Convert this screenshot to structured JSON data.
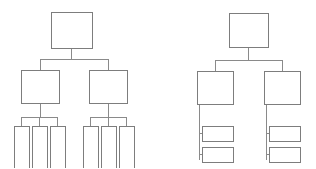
{
  "page": {
    "background_color": "#ffffff",
    "width": 316,
    "height": 168
  },
  "style": {
    "box_fill": "#ffffff",
    "box_stroke": "#7d7d7d",
    "connector_stroke": "#8a8a8a",
    "stroke_width": 1
  },
  "diagrams": [
    {
      "id": "left-tree",
      "name": "left-tree-diagram",
      "label": "",
      "layout": "centered-branching",
      "levels": 3,
      "nodes": [
        {
          "id": "L-root",
          "name": "left-root-node",
          "label": "",
          "x": 51,
          "y": 12,
          "w": 41,
          "h": 36,
          "level": 0
        },
        {
          "id": "L-m1",
          "name": "left-mid-node-1",
          "label": "",
          "x": 21,
          "y": 70,
          "w": 38,
          "h": 33,
          "level": 1
        },
        {
          "id": "L-m2",
          "name": "left-mid-node-2",
          "label": "",
          "x": 89,
          "y": 70,
          "w": 38,
          "h": 33,
          "level": 1
        },
        {
          "id": "L-a1",
          "name": "left-leaf-node-1",
          "label": "",
          "x": 14,
          "y": 126,
          "w": 15,
          "h": 42,
          "level": 2
        },
        {
          "id": "L-a2",
          "name": "left-leaf-node-2",
          "label": "",
          "x": 32,
          "y": 126,
          "w": 15,
          "h": 42,
          "level": 2
        },
        {
          "id": "L-a3",
          "name": "left-leaf-node-3",
          "label": "",
          "x": 50,
          "y": 126,
          "w": 15,
          "h": 42,
          "level": 2
        },
        {
          "id": "L-b1",
          "name": "left-leaf-node-4",
          "label": "",
          "x": 83,
          "y": 126,
          "w": 15,
          "h": 42,
          "level": 2
        },
        {
          "id": "L-b2",
          "name": "left-leaf-node-5",
          "label": "",
          "x": 101,
          "y": 126,
          "w": 15,
          "h": 42,
          "level": 2
        },
        {
          "id": "L-b3",
          "name": "left-leaf-node-6",
          "label": "",
          "x": 119,
          "y": 126,
          "w": 15,
          "h": 42,
          "level": 2
        }
      ],
      "connectors": [
        {
          "name": "left-root-stem",
          "d": "M71.5,48 L71.5,59"
        },
        {
          "name": "left-root-bus",
          "d": "M40,59 L108,59"
        },
        {
          "name": "left-bus-drop-1",
          "d": "M40,59 L40,70"
        },
        {
          "name": "left-bus-drop-2",
          "d": "M108,59 L108,70"
        },
        {
          "name": "left-mid1-stem",
          "d": "M40,103 L40,117"
        },
        {
          "name": "left-mid1-bus",
          "d": "M21.5,117 L57.5,117"
        },
        {
          "name": "left-leaf1-drop",
          "d": "M21.5,117 L21.5,126"
        },
        {
          "name": "left-leaf2-drop",
          "d": "M39.5,117 L39.5,126"
        },
        {
          "name": "left-leaf3-drop",
          "d": "M57.5,117 L57.5,126"
        },
        {
          "name": "left-mid2-stem",
          "d": "M108,103 L108,117"
        },
        {
          "name": "left-mid2-bus",
          "d": "M90.5,117 L126.5,117"
        },
        {
          "name": "left-leaf4-drop",
          "d": "M90.5,117 L90.5,126"
        },
        {
          "name": "left-leaf5-drop",
          "d": "M108.5,117 L108.5,126"
        },
        {
          "name": "left-leaf6-drop",
          "d": "M126.5,117 L126.5,126"
        }
      ]
    },
    {
      "id": "right-tree",
      "name": "right-tree-diagram",
      "label": "",
      "layout": "left-spine-branching",
      "levels": 3,
      "nodes": [
        {
          "id": "R-root",
          "name": "right-root-node",
          "label": "",
          "x": 229,
          "y": 13,
          "w": 39,
          "h": 34,
          "level": 0
        },
        {
          "id": "R-m1",
          "name": "right-mid-node-1",
          "label": "",
          "x": 197,
          "y": 71,
          "w": 36,
          "h": 33,
          "level": 1
        },
        {
          "id": "R-m2",
          "name": "right-mid-node-2",
          "label": "",
          "x": 264,
          "y": 71,
          "w": 36,
          "h": 33,
          "level": 1
        },
        {
          "id": "R-a1",
          "name": "right-leaf-node-1",
          "label": "",
          "x": 202,
          "y": 126,
          "w": 31,
          "h": 15,
          "level": 2
        },
        {
          "id": "R-a2",
          "name": "right-leaf-node-2",
          "label": "",
          "x": 202,
          "y": 147,
          "w": 31,
          "h": 15,
          "level": 2
        },
        {
          "id": "R-b1",
          "name": "right-leaf-node-3",
          "label": "",
          "x": 269,
          "y": 126,
          "w": 31,
          "h": 15,
          "level": 2
        },
        {
          "id": "R-b2",
          "name": "right-leaf-node-4",
          "label": "",
          "x": 269,
          "y": 147,
          "w": 31,
          "h": 15,
          "level": 2
        }
      ],
      "connectors": [
        {
          "name": "right-root-stem",
          "d": "M248.5,47 L248.5,60"
        },
        {
          "name": "right-root-bus",
          "d": "M215,60 L282,60"
        },
        {
          "name": "right-bus-drop-1",
          "d": "M215,60 L215,71"
        },
        {
          "name": "right-bus-drop-2",
          "d": "M282,60 L282,71"
        },
        {
          "name": "right-mid1-spine",
          "d": "M199,104 L199,160"
        },
        {
          "name": "right-leaf1-arm",
          "d": "M199,133.5 L202,133.5"
        },
        {
          "name": "right-leaf2-arm",
          "d": "M199,154.5 L202,154.5"
        },
        {
          "name": "right-mid2-spine",
          "d": "M266,104 L266,160"
        },
        {
          "name": "right-leaf3-arm",
          "d": "M266,133.5 L269,133.5"
        },
        {
          "name": "right-leaf4-arm",
          "d": "M266,154.5 L269,154.5"
        }
      ]
    }
  ]
}
